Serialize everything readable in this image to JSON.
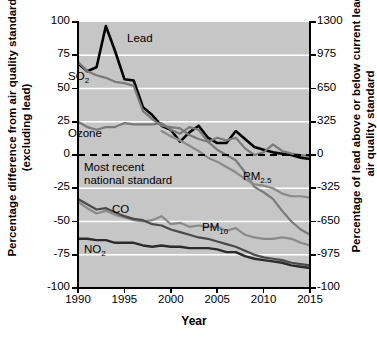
{
  "chart_data": {
    "type": "line",
    "title": "",
    "xlabel": "Year",
    "ylabel": "Percentage difference from air quality standard (excluding lead)",
    "ylabel_right": "Percentage of lead above or below current lead air quality standard",
    "xlim": [
      1990,
      2015
    ],
    "ylim": [
      -100,
      100
    ],
    "ylim_right": [
      -100,
      1300
    ],
    "xticks": [
      1990,
      1995,
      2000,
      2005,
      2010,
      2015
    ],
    "xticklabels": [
      "1990",
      "1995",
      "2000",
      "2005",
      "2010",
      "2015"
    ],
    "yticks": [
      -100,
      -75,
      -50,
      -25,
      0,
      25,
      50,
      75,
      100
    ],
    "yticklabels": [
      "-100",
      "-75",
      "-50",
      "-25",
      "0",
      "25",
      "50",
      "75",
      "100"
    ],
    "yticks_right": [
      -100,
      -975,
      -650,
      -325,
      0,
      325,
      650,
      975,
      1300
    ],
    "yticklabels_right": [
      "-100",
      "-975",
      "-650",
      "-325",
      "0",
      "325",
      "650",
      "975",
      "1300"
    ],
    "grid": "horizontal-white",
    "plot_background": "#c6c6c6",
    "annotations": [
      {
        "text": "Most recent",
        "note": "zero reference line label line 1"
      },
      {
        "text": "national standard",
        "note": "zero reference line label line 2"
      }
    ],
    "reference_line": {
      "value": 0,
      "style": "dashed",
      "color": "#000000"
    },
    "x": [
      1990,
      1991,
      1992,
      1993,
      1994,
      1995,
      1996,
      1997,
      1998,
      1999,
      2000,
      2001,
      2002,
      2003,
      2004,
      2005,
      2006,
      2007,
      2008,
      2009,
      2010,
      2011,
      2012,
      2013,
      2014,
      2015
    ],
    "series": [
      {
        "name": "Lead",
        "label": "Lead",
        "color": "#000000",
        "width": 2.6,
        "axis": "right",
        "values": [
          69,
          63,
          66,
          97,
          78,
          57,
          56,
          36,
          30,
          22,
          19,
          10,
          17,
          22,
          13,
          9,
          9,
          18,
          12,
          6,
          4,
          2,
          1,
          0,
          -2,
          -3
        ]
      },
      {
        "name": "SO2",
        "label": "SO₂",
        "color": "#7a7a7a",
        "width": 2.2,
        "axis": "left",
        "values": [
          70,
          63,
          60,
          58,
          55,
          54,
          52,
          33,
          27,
          22,
          21,
          20,
          15,
          12,
          10,
          4,
          0,
          -4,
          -13,
          -24,
          -28,
          -33,
          -42,
          -50,
          -56,
          -60
        ]
      },
      {
        "name": "Ozone",
        "label": "Ozone",
        "color": "#7a7a7a",
        "width": 2.2,
        "axis": "left",
        "values": [
          25,
          21,
          19,
          21,
          21,
          24,
          23,
          23,
          23,
          24,
          19,
          16,
          21,
          19,
          10,
          13,
          11,
          13,
          5,
          0,
          2,
          8,
          3,
          1,
          0,
          -1
        ]
      },
      {
        "name": "PM2.5",
        "label": "PM₂.₅",
        "color": "#8a8a8a",
        "width": 2.2,
        "axis": "left",
        "values": [
          null,
          null,
          null,
          null,
          null,
          null,
          null,
          null,
          null,
          18,
          14,
          11,
          7,
          3,
          -2,
          -5,
          -9,
          -13,
          -18,
          -22,
          -23,
          -25,
          -29,
          -31,
          -31,
          -32
        ]
      },
      {
        "name": "PM10",
        "label": "PM₁₀",
        "color": "#8a8a8a",
        "width": 2.2,
        "axis": "left",
        "values": [
          -35,
          -40,
          -44,
          -42,
          -45,
          -47,
          -49,
          -50,
          -49,
          -46,
          -52,
          -51,
          -54,
          -53,
          -54,
          -54,
          -57,
          -55,
          -60,
          -62,
          -63,
          -63,
          -62,
          -63,
          -66,
          -68
        ]
      },
      {
        "name": "CO",
        "label": "CO",
        "color": "#4a4a4a",
        "width": 2.2,
        "axis": "left",
        "values": [
          -33,
          -37,
          -41,
          -40,
          -43,
          -46,
          -48,
          -49,
          -52,
          -53,
          -56,
          -58,
          -60,
          -62,
          -63,
          -65,
          -67,
          -69,
          -72,
          -75,
          -77,
          -78,
          -79,
          -81,
          -82,
          -83
        ]
      },
      {
        "name": "NO2",
        "label": "NO₂",
        "color": "#2b2b2b",
        "width": 2.4,
        "axis": "left",
        "values": [
          -63,
          -63,
          -64,
          -64,
          -66,
          -66,
          -66,
          -68,
          -69,
          -68,
          -69,
          -69,
          -70,
          -70,
          -70,
          -71,
          -73,
          -73,
          -76,
          -78,
          -79,
          -80,
          -81,
          -83,
          -84,
          -85
        ]
      }
    ]
  },
  "labels": {
    "lead": "Lead",
    "so2": "SO",
    "so2_sub": "2",
    "ozone": "Ozone",
    "pm25": "PM",
    "pm25_sub": "2.5",
    "pm10": "PM",
    "pm10_sub": "10",
    "co": "CO",
    "no2": "NO",
    "no2_sub": "2",
    "note_line1": "Most recent",
    "note_line2": "national standard"
  },
  "axes": {
    "xlabel": "Year",
    "ylabel_left": "Percentage difference from air quality standard (excluding lead)",
    "ylabel_right": "Percentage of lead above or below current lead air quality standard"
  }
}
